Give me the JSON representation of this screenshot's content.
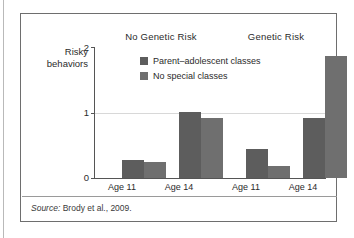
{
  "figure": {
    "source_label": "Source:",
    "source_text": "Brody et al., 2009."
  },
  "chart_data": {
    "type": "bar",
    "title": "",
    "xlabel": "",
    "ylabel": "Risky behaviors",
    "ylabel_line1": "Risky",
    "ylabel_line2": "behaviors",
    "ylim": [
      0,
      2
    ],
    "yticks": [
      0,
      1,
      2
    ],
    "ytick_labels": [
      "0",
      "1",
      "2"
    ],
    "grid": "horizontal-at-1",
    "legend_position": "inside-top-center",
    "panels": [
      {
        "name": "No Genetic Risk",
        "categories": [
          "Age 11",
          "Age 14"
        ]
      },
      {
        "name": "Genetic Risk",
        "categories": [
          "Age 11",
          "Age 14"
        ]
      }
    ],
    "categories": [
      "Age 11",
      "Age 14",
      "Age 11",
      "Age 14"
    ],
    "series": [
      {
        "name": "Parent–adolescent classes",
        "color": "#5d5d5d",
        "values": [
          0.27,
          1.02,
          0.45,
          0.92
        ]
      },
      {
        "name": "No special classes",
        "color": "#6f6f6f",
        "values": [
          0.24,
          0.92,
          0.18,
          1.87
        ]
      }
    ]
  }
}
